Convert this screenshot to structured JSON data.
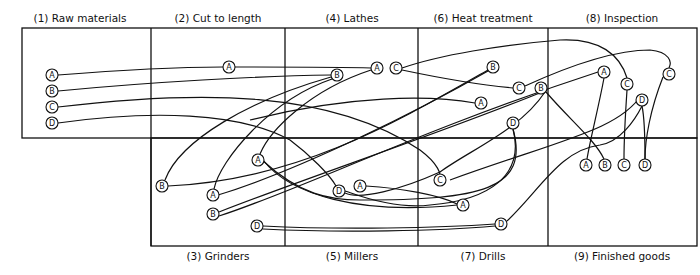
{
  "departments": [
    {
      "id": 1,
      "label": "(1) Raw materials",
      "x": 80,
      "y": 12
    },
    {
      "id": 2,
      "label": "(2) Cut to length",
      "x": 218,
      "y": 12
    },
    {
      "id": 4,
      "label": "(4) Lathes",
      "x": 352,
      "y": 12
    },
    {
      "id": 6,
      "label": "(6) Heat treatment",
      "x": 483,
      "y": 12
    },
    {
      "id": 8,
      "label": "(8) Inspection",
      "x": 622,
      "y": 12
    },
    {
      "id": 3,
      "label": "(3) Grinders",
      "x": 218,
      "y": 250
    },
    {
      "id": 5,
      "label": "(5) Millers",
      "x": 352,
      "y": 250
    },
    {
      "id": 7,
      "label": "(7) Drills",
      "x": 483,
      "y": 250
    },
    {
      "id": 9,
      "label": "(9) Finished goods",
      "x": 622,
      "y": 250
    }
  ],
  "nodes": [
    {
      "id": "rA",
      "letter": "A",
      "x": 52,
      "y": 75
    },
    {
      "id": "rB",
      "letter": "B",
      "x": 52,
      "y": 91
    },
    {
      "id": "rC",
      "letter": "C",
      "x": 52,
      "y": 107
    },
    {
      "id": "rD",
      "letter": "D",
      "x": 52,
      "y": 123
    },
    {
      "id": "cA",
      "letter": "A",
      "x": 229,
      "y": 67
    },
    {
      "id": "lB",
      "letter": "B",
      "x": 337,
      "y": 75
    },
    {
      "id": "lA",
      "letter": "A",
      "x": 377,
      "y": 68
    },
    {
      "id": "lC",
      "letter": "C",
      "x": 396,
      "y": 68
    },
    {
      "id": "hB",
      "letter": "B",
      "x": 493,
      "y": 67
    },
    {
      "id": "hC",
      "letter": "C",
      "x": 519,
      "y": 88
    },
    {
      "id": "hA",
      "letter": "A",
      "x": 481,
      "y": 103
    },
    {
      "id": "hD",
      "letter": "D",
      "x": 513,
      "y": 123
    },
    {
      "id": "iA",
      "letter": "A",
      "x": 604,
      "y": 72
    },
    {
      "id": "iC2",
      "letter": "C",
      "x": 669,
      "y": 74
    },
    {
      "id": "iC",
      "letter": "C",
      "x": 627,
      "y": 84
    },
    {
      "id": "iB",
      "letter": "B",
      "x": 541,
      "y": 88
    },
    {
      "id": "iD",
      "letter": "D",
      "x": 642,
      "y": 100
    },
    {
      "id": "fA",
      "letter": "A",
      "x": 586,
      "y": 165
    },
    {
      "id": "fB",
      "letter": "B",
      "x": 605,
      "y": 165
    },
    {
      "id": "fC",
      "letter": "C",
      "x": 624,
      "y": 165
    },
    {
      "id": "fD",
      "letter": "D",
      "x": 645,
      "y": 165
    },
    {
      "id": "gB1",
      "letter": "B",
      "x": 162,
      "y": 186
    },
    {
      "id": "gA2",
      "letter": "A",
      "x": 258,
      "y": 160
    },
    {
      "id": "gA",
      "letter": "A",
      "x": 213,
      "y": 195
    },
    {
      "id": "gB",
      "letter": "B",
      "x": 213,
      "y": 214
    },
    {
      "id": "gD",
      "letter": "D",
      "x": 257,
      "y": 226
    },
    {
      "id": "mD",
      "letter": "D",
      "x": 339,
      "y": 191
    },
    {
      "id": "mA",
      "letter": "A",
      "x": 360,
      "y": 186
    },
    {
      "id": "dC",
      "letter": "C",
      "x": 440,
      "y": 180
    },
    {
      "id": "dA",
      "letter": "A",
      "x": 463,
      "y": 205
    },
    {
      "id": "dD",
      "letter": "D",
      "x": 501,
      "y": 224
    }
  ],
  "paths": [
    "M58,75 C120,70 180,67 223,67",
    "M235,67 C290,67 340,67 371,68",
    "M58,91 C150,82 260,76 331,75",
    "M58,107 C200,90 330,90 420,150 C440,165 440,175 440,175",
    "M58,123 C150,110 240,112 290,140 C310,155 330,175 336,186",
    "M331,77 C250,100 180,140 165,180",
    "M332,79 C270,100 220,160 214,189",
    "M371,70 C310,90 270,130 260,154",
    "M402,68 C440,55 500,45 560,40 C600,38 620,55 627,78",
    "M402,70 C440,78 480,85 513,88",
    "M525,86 C560,70 610,50 650,50 C670,52 672,62 669,68",
    "M488,70 C400,120 300,180 168,186",
    "M488,71 C420,110 300,170 218,195",
    "M250,120 C350,95 430,95 475,103",
    "M547,90 C450,130 300,180 219,212",
    "M219,216 C300,190 420,130 598,72",
    "M546,92 C570,120 595,140 604,159",
    "M604,78 C598,110 590,140 587,159",
    "M627,90 C625,120 624,140 624,159",
    "M663,77 C650,110 645,140 645,159",
    "M642,106 C645,120 645,140 645,159",
    "M642,94 C620,130 560,140 450,180",
    "M513,129 C530,190 480,200 360,200 C330,200 300,195 262,160",
    "M513,129 C525,175 490,200 430,205 C390,210 350,192 345,191",
    "M263,160 C290,195 360,215 457,205",
    "M366,186 C400,188 440,195 457,204",
    "M345,193 C360,200 400,190 440,172 C470,150 520,130 545,92",
    "M263,226 C340,230 440,228 495,224",
    "M263,229 C340,233 440,231 495,226",
    "M507,221 C540,190 560,150 600,145 C620,142 635,120 642,106"
  ],
  "colors": {
    "stroke": "#111111",
    "background": "#ffffff"
  }
}
